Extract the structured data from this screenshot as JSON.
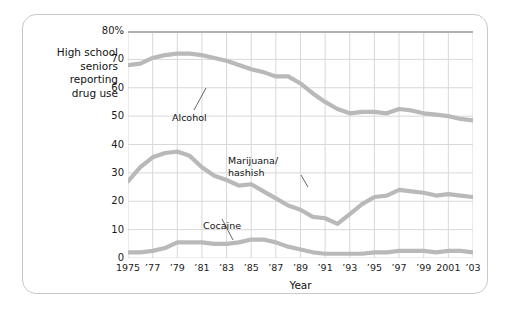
{
  "caption": {
    "line1": "High school",
    "line2": "seniors",
    "line3": "reporting",
    "line4": "drug use"
  },
  "axes": {
    "xlabel": "Year",
    "ytick_labels": [
      "0",
      "10",
      "20",
      "30",
      "40",
      "50",
      "60",
      "70",
      "80%"
    ],
    "xtick_labels": [
      "1975",
      "’77",
      "’79",
      "’81",
      "’83",
      "’85",
      "’87",
      "’89",
      "’91",
      "’93",
      "’95",
      "’97",
      "’99",
      "2001",
      "’03"
    ]
  },
  "annotations": {
    "alcohol": "Alcohol",
    "marijuana_line1": "Marijuana/",
    "marijuana_line2": "hashish",
    "cocaine": "Cocaine"
  },
  "colors": {
    "series_line": "#b9b9b9",
    "grid": "#d8d8d8",
    "plot_top_border": "#b0b0b0",
    "card_border": "#c9c9c9",
    "text": "#111111",
    "background": "#ffffff"
  },
  "chart_data": {
    "type": "line",
    "title": "",
    "xlabel": "Year",
    "ylabel": "",
    "xlim": [
      1975,
      2003
    ],
    "ylim": [
      0,
      80
    ],
    "grid": true,
    "legend": "annotated-inline",
    "x": [
      1975,
      1976,
      1977,
      1978,
      1979,
      1980,
      1981,
      1982,
      1983,
      1984,
      1985,
      1986,
      1987,
      1988,
      1989,
      1990,
      1991,
      1992,
      1993,
      1994,
      1995,
      1996,
      1997,
      1998,
      1999,
      2000,
      2001,
      2002,
      2003
    ],
    "series": [
      {
        "name": "Alcohol",
        "values": [
          68.0,
          68.5,
          70.5,
          71.5,
          72.0,
          72.0,
          71.5,
          70.5,
          69.5,
          68.0,
          66.5,
          65.5,
          64.0,
          64.0,
          61.5,
          58.0,
          55.0,
          52.5,
          51.0,
          51.5,
          51.5,
          51.0,
          52.5,
          52.0,
          51.0,
          50.5,
          50.0,
          49.0,
          48.5
        ]
      },
      {
        "name": "Marijuana/hashish",
        "values": [
          27.0,
          32.0,
          35.5,
          37.0,
          37.5,
          36.0,
          32.0,
          29.0,
          27.5,
          25.5,
          26.0,
          23.5,
          21.0,
          18.5,
          17.0,
          14.5,
          14.0,
          12.0,
          15.5,
          19.0,
          21.5,
          22.0,
          24.0,
          23.5,
          23.0,
          22.0,
          22.5,
          22.0,
          21.5
        ]
      },
      {
        "name": "Cocaine",
        "values": [
          2.0,
          2.0,
          2.5,
          3.5,
          5.5,
          5.5,
          5.5,
          5.0,
          5.0,
          5.5,
          6.5,
          6.5,
          5.5,
          4.0,
          3.0,
          2.0,
          1.5,
          1.5,
          1.5,
          1.5,
          2.0,
          2.0,
          2.5,
          2.5,
          2.5,
          2.0,
          2.5,
          2.5,
          2.0
        ]
      }
    ]
  }
}
